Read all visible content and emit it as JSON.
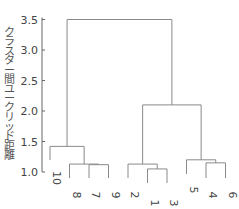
{
  "chart_data": {
    "type": "dendrogram",
    "title": "",
    "xlabel": "",
    "ylabel": "クラスター間ユークリッド距離",
    "ylim": [
      1.0,
      3.5
    ],
    "yticks": [
      1.0,
      1.5,
      2.0,
      2.5,
      3.0,
      3.5
    ],
    "ytick_labels": [
      "1.0",
      "1.5",
      "2.0",
      "2.5",
      "3.0",
      "3.5"
    ],
    "grid": false,
    "leaf_order": [
      "10",
      "8",
      "7",
      "9",
      "2",
      "1",
      "3",
      "5",
      "4",
      "6"
    ],
    "merges": [
      {
        "a": "1",
        "b": "3",
        "height": 1.05
      },
      {
        "a": "7",
        "b": "9",
        "height": 1.12
      },
      {
        "a": "8",
        "b": "(7,9)",
        "height": 1.13
      },
      {
        "a": "2",
        "b": "(1,3)",
        "height": 1.13
      },
      {
        "a": "4",
        "b": "6",
        "height": 1.15
      },
      {
        "a": "5",
        "b": "(4,6)",
        "height": 1.2
      },
      {
        "a": "10",
        "b": "(8,(7,9))",
        "height": 1.42
      },
      {
        "a": "(2,(1,3))",
        "b": "(5,(4,6))",
        "height": 2.1
      },
      {
        "a": "(10,(8,(7,9)))",
        "b": "((2,(1,3)),(5,(4,6)))",
        "height": 3.5
      }
    ]
  },
  "colors": {
    "branch": "#8a8a8a",
    "axis": "#666666",
    "text": "#444444"
  }
}
